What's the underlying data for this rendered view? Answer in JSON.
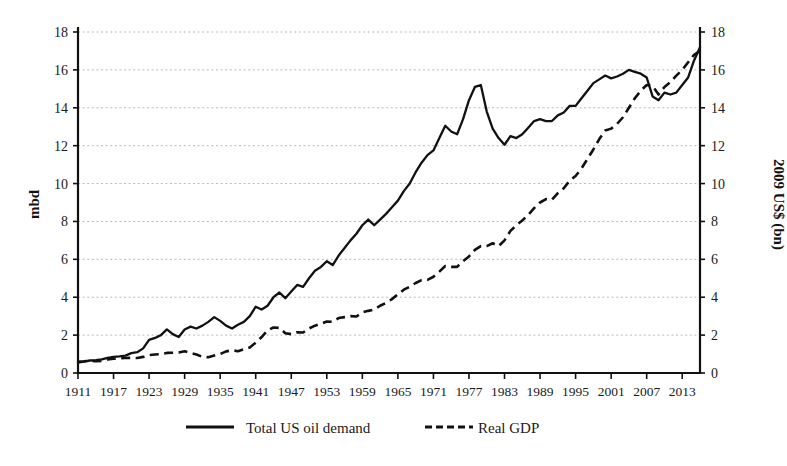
{
  "chart_data": {
    "type": "line",
    "title": "",
    "subtitle": "",
    "xlabel": "",
    "ylabel": "mbd",
    "ylabel_right": "2009 US$ (bn)",
    "xlim": [
      1911,
      2016
    ],
    "ylim": [
      0,
      18
    ],
    "ylim_right": [
      0,
      18
    ],
    "grid": true,
    "legend_position": "bottom",
    "xticks": [
      1911,
      1917,
      1923,
      1929,
      1935,
      1941,
      1947,
      1953,
      1959,
      1965,
      1971,
      1977,
      1983,
      1989,
      1995,
      2001,
      2007,
      2013
    ],
    "xtick_labels": [
      "1911",
      "1917",
      "1923",
      "1929",
      "1935",
      "1941",
      "1947",
      "1953",
      "1959",
      "1965",
      "1971",
      "1977",
      "1983",
      "1989",
      "1995",
      "2001",
      "2007",
      "2013"
    ],
    "yticks": [
      0,
      2,
      4,
      6,
      8,
      10,
      12,
      14,
      16,
      18
    ],
    "ytick_labels": [
      "0",
      "2",
      "4",
      "6",
      "8",
      "10",
      "12",
      "14",
      "16",
      "18"
    ],
    "yticks_right": [
      0,
      2,
      4,
      6,
      8,
      10,
      12,
      14,
      16,
      18
    ],
    "ytick_labels_right": [
      "0",
      "2",
      "4",
      "6",
      "8",
      "10",
      "12",
      "14",
      "16",
      "18"
    ],
    "x": [
      1911,
      1912,
      1913,
      1914,
      1915,
      1916,
      1917,
      1918,
      1919,
      1920,
      1921,
      1922,
      1923,
      1924,
      1925,
      1926,
      1927,
      1928,
      1929,
      1930,
      1931,
      1932,
      1933,
      1934,
      1935,
      1936,
      1937,
      1938,
      1939,
      1940,
      1941,
      1942,
      1943,
      1944,
      1945,
      1946,
      1947,
      1948,
      1949,
      1950,
      1951,
      1952,
      1953,
      1954,
      1955,
      1956,
      1957,
      1958,
      1959,
      1960,
      1961,
      1962,
      1963,
      1964,
      1965,
      1966,
      1967,
      1968,
      1969,
      1970,
      1971,
      1972,
      1973,
      1974,
      1975,
      1976,
      1977,
      1978,
      1979,
      1980,
      1981,
      1982,
      1983,
      1984,
      1985,
      1986,
      1987,
      1988,
      1989,
      1990,
      1991,
      1992,
      1993,
      1994,
      1995,
      1996,
      1997,
      1998,
      1999,
      2000,
      2001,
      2002,
      2003,
      2004,
      2005,
      2006,
      2007,
      2008,
      2009,
      2010,
      2011,
      2012,
      2013,
      2014,
      2015,
      2016
    ],
    "series": [
      {
        "name": "Total US oil demand",
        "axis": "left",
        "units": "mbd",
        "style": "solid",
        "color": "#111111",
        "values": [
          0.55,
          0.6,
          0.66,
          0.68,
          0.72,
          0.8,
          0.85,
          0.88,
          0.92,
          1.05,
          1.1,
          1.3,
          1.75,
          1.85,
          2.0,
          2.3,
          2.05,
          1.9,
          2.3,
          2.45,
          2.35,
          2.5,
          2.7,
          2.95,
          2.75,
          2.5,
          2.35,
          2.55,
          2.7,
          3.0,
          3.5,
          3.35,
          3.55,
          4.0,
          4.25,
          3.95,
          4.3,
          4.65,
          4.55,
          5.0,
          5.4,
          5.6,
          5.9,
          5.7,
          6.2,
          6.6,
          7.0,
          7.35,
          7.8,
          8.1,
          7.8,
          8.1,
          8.4,
          8.75,
          9.1,
          9.6,
          10.0,
          10.6,
          11.1,
          11.5,
          11.75,
          12.4,
          13.05,
          12.75,
          12.6,
          13.4,
          14.4,
          15.1,
          15.2,
          13.8,
          12.9,
          12.4,
          12.05,
          12.5,
          12.4,
          12.6,
          12.95,
          13.3,
          13.4,
          13.3,
          13.3,
          13.6,
          13.75,
          14.1,
          14.1,
          14.5,
          14.9,
          15.3,
          15.5,
          15.7,
          15.55,
          15.65,
          15.8,
          16.0,
          15.9,
          15.8,
          15.6,
          14.6,
          14.4,
          14.8,
          14.7,
          14.8,
          15.2,
          15.6,
          16.5,
          17.2
        ]
      },
      {
        "name": "Real GDP",
        "axis": "right",
        "units": "2009 US$ (bn)",
        "style": "dashed",
        "color": "#111111",
        "values": [
          0.6,
          0.62,
          0.65,
          0.62,
          0.64,
          0.72,
          0.75,
          0.78,
          0.79,
          0.8,
          0.79,
          0.85,
          0.95,
          0.98,
          1.0,
          1.06,
          1.07,
          1.08,
          1.15,
          1.05,
          0.98,
          0.85,
          0.83,
          0.92,
          1.0,
          1.14,
          1.2,
          1.15,
          1.25,
          1.35,
          1.6,
          1.9,
          2.25,
          2.4,
          2.38,
          2.1,
          2.05,
          2.15,
          2.14,
          2.35,
          2.5,
          2.6,
          2.72,
          2.7,
          2.9,
          2.95,
          3.0,
          2.98,
          3.2,
          3.28,
          3.35,
          3.55,
          3.7,
          3.9,
          4.15,
          4.4,
          4.55,
          4.75,
          4.9,
          4.92,
          5.08,
          5.35,
          5.65,
          5.6,
          5.6,
          5.9,
          6.15,
          6.5,
          6.7,
          6.7,
          6.85,
          6.7,
          7.0,
          7.5,
          7.8,
          8.05,
          8.35,
          8.7,
          9.0,
          9.18,
          9.15,
          9.5,
          9.75,
          10.15,
          10.4,
          10.8,
          11.3,
          11.8,
          12.35,
          12.8,
          12.9,
          13.15,
          13.5,
          14.0,
          14.5,
          14.9,
          15.2,
          15.15,
          14.7,
          15.1,
          15.35,
          15.7,
          16.0,
          16.4,
          16.8,
          17.0
        ]
      }
    ],
    "legend": [
      {
        "label": "Total US oil demand",
        "style": "solid"
      },
      {
        "label": "Real GDP",
        "style": "dashed"
      }
    ]
  }
}
